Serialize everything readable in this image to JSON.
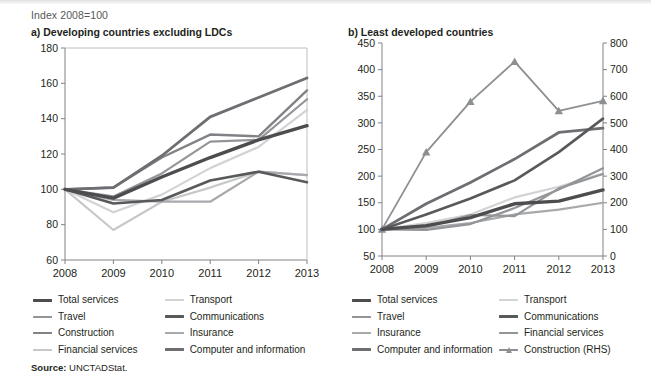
{
  "index_note": "Index 2008=100",
  "source": {
    "label": "Source:",
    "value": "UNCTADStat."
  },
  "colors": {
    "total_services": "#4d4d4f",
    "travel": "#939598",
    "construction": "#808285",
    "financial_services": "#c7c8ca",
    "transport": "#d1d3d4",
    "communications": "#58595b",
    "insurance": "#a7a9ac",
    "computer_and_information": "#6d6e71",
    "construction_rhs": "#8d9093",
    "axis": "#808285",
    "text": "#231f20"
  },
  "panel_a": {
    "title": "a) Developing countries excluding LDCs",
    "legend": [
      [
        {
          "key": "total_services",
          "label": "Total services",
          "color": "#4d4d4f",
          "width": 3.4,
          "marker": false
        },
        {
          "key": "transport",
          "label": "Transport",
          "color": "#d1d3d4",
          "width": 2.2,
          "marker": false
        }
      ],
      [
        {
          "key": "travel",
          "label": "Travel",
          "color": "#939598",
          "width": 2.2,
          "marker": false
        },
        {
          "key": "communications",
          "label": "Communications",
          "color": "#58595b",
          "width": 2.6,
          "marker": false
        }
      ],
      [
        {
          "key": "construction",
          "label": "Construction",
          "color": "#808285",
          "width": 2.4,
          "marker": false
        },
        {
          "key": "insurance",
          "label": "Insurance",
          "color": "#a7a9ac",
          "width": 2.2,
          "marker": false
        }
      ],
      [
        {
          "key": "financial_services",
          "label": "Financial services",
          "color": "#c7c8ca",
          "width": 2.2,
          "marker": false
        },
        {
          "key": "computer_and_information",
          "label": "Computer and information",
          "color": "#6d6e71",
          "width": 2.8,
          "marker": false
        }
      ]
    ]
  },
  "panel_b": {
    "title": "b) Least developed countries",
    "legend": [
      [
        {
          "key": "total_services",
          "label": "Total services",
          "color": "#4d4d4f",
          "width": 3.4,
          "marker": false
        },
        {
          "key": "transport",
          "label": "Transport",
          "color": "#d1d3d4",
          "width": 2.2,
          "marker": false
        }
      ],
      [
        {
          "key": "travel",
          "label": "Travel",
          "color": "#939598",
          "width": 2.2,
          "marker": false
        },
        {
          "key": "communications",
          "label": "Communications",
          "color": "#58595b",
          "width": 2.6,
          "marker": false
        }
      ],
      [
        {
          "key": "insurance",
          "label": "Insurance",
          "color": "#a7a9ac",
          "width": 2.2,
          "marker": false
        },
        {
          "key": "financial_services",
          "label": "Financial services",
          "color": "#939598",
          "width": 2.2,
          "marker": false
        }
      ],
      [
        {
          "key": "computer_and_information",
          "label": "Computer and information",
          "color": "#6d6e71",
          "width": 2.8,
          "marker": false
        },
        {
          "key": "construction_rhs",
          "label": "Construction (RHS)",
          "color": "#8d9093",
          "width": 1.8,
          "marker": true
        }
      ]
    ]
  },
  "chart_data": [
    {
      "id": "panel-a",
      "type": "line",
      "title": "a) Developing countries excluding LDCs",
      "subtitle": "Index 2008=100",
      "xlabel": "",
      "ylabel": "",
      "x": [
        2008,
        2009,
        2010,
        2011,
        2012,
        2013
      ],
      "xticks": [
        "2008",
        "2009",
        "2010",
        "2011",
        "2012",
        "2013"
      ],
      "ylim": [
        60,
        180
      ],
      "yticks": [
        60,
        80,
        100,
        120,
        140,
        160,
        180
      ],
      "grid": false,
      "legend_position": "below",
      "series": [
        {
          "name": "Total services",
          "color": "#4d4d4f",
          "width": 3.4,
          "values": [
            100,
            95,
            107,
            118,
            128,
            136
          ]
        },
        {
          "name": "Transport",
          "color": "#d1d3d4",
          "width": 2.2,
          "values": [
            100,
            87,
            97,
            112,
            124,
            145
          ]
        },
        {
          "name": "Travel",
          "color": "#939598",
          "width": 2.2,
          "values": [
            100,
            96,
            109,
            127,
            128,
            151
          ]
        },
        {
          "name": "Communications",
          "color": "#58595b",
          "width": 2.6,
          "values": [
            100,
            92,
            94,
            105,
            110,
            104
          ]
        },
        {
          "name": "Construction",
          "color": "#808285",
          "width": 2.4,
          "values": [
            100,
            101,
            118,
            131,
            130,
            156
          ]
        },
        {
          "name": "Insurance",
          "color": "#a7a9ac",
          "width": 2.2,
          "values": [
            100,
            94,
            93,
            93,
            110,
            108
          ]
        },
        {
          "name": "Financial services",
          "color": "#c7c8ca",
          "width": 2.2,
          "values": [
            100,
            77,
            93,
            101,
            110,
            108
          ]
        },
        {
          "name": "Computer and information",
          "color": "#6d6e71",
          "width": 2.8,
          "values": [
            100,
            101,
            119,
            141,
            152,
            163
          ]
        }
      ]
    },
    {
      "id": "panel-b",
      "type": "line",
      "title": "b) Least developed countries",
      "subtitle": "Index 2008=100",
      "xlabel": "",
      "ylabel": "",
      "x": [
        2008,
        2009,
        2010,
        2011,
        2012,
        2013
      ],
      "xticks": [
        "2008",
        "2009",
        "2010",
        "2011",
        "2012",
        "2013"
      ],
      "ylim": [
        50,
        450
      ],
      "yticks": [
        50,
        100,
        150,
        200,
        250,
        300,
        350,
        400,
        450
      ],
      "ylim_right": [
        0,
        800
      ],
      "yticks_right": [
        0,
        100,
        200,
        300,
        400,
        500,
        600,
        700,
        800
      ],
      "grid": false,
      "legend_position": "below",
      "series": [
        {
          "name": "Total services",
          "color": "#4d4d4f",
          "width": 3.4,
          "axis": "left",
          "values": [
            100,
            107,
            122,
            148,
            153,
            174
          ]
        },
        {
          "name": "Transport",
          "color": "#d1d3d4",
          "width": 2.2,
          "axis": "left",
          "values": [
            100,
            112,
            128,
            160,
            180,
            205
          ]
        },
        {
          "name": "Travel",
          "color": "#939598",
          "width": 2.2,
          "axis": "left",
          "values": [
            100,
            99,
            110,
            140,
            175,
            215
          ]
        },
        {
          "name": "Communications",
          "color": "#58595b",
          "width": 2.6,
          "axis": "left",
          "values": [
            100,
            128,
            158,
            192,
            245,
            308
          ]
        },
        {
          "name": "Insurance",
          "color": "#a7a9ac",
          "width": 2.2,
          "axis": "left",
          "values": [
            100,
            103,
            112,
            128,
            137,
            150
          ]
        },
        {
          "name": "Financial services",
          "color": "#939598",
          "width": 2.2,
          "axis": "left",
          "values": [
            100,
            104,
            127,
            125,
            177,
            204
          ]
        },
        {
          "name": "Computer and information",
          "color": "#6d6e71",
          "width": 2.8,
          "axis": "left",
          "values": [
            100,
            148,
            188,
            232,
            282,
            290
          ]
        },
        {
          "name": "Construction (RHS)",
          "color": "#8d9093",
          "width": 1.8,
          "axis": "right",
          "marker": "triangle",
          "values": [
            100,
            390,
            580,
            730,
            545,
            583
          ]
        }
      ]
    }
  ]
}
